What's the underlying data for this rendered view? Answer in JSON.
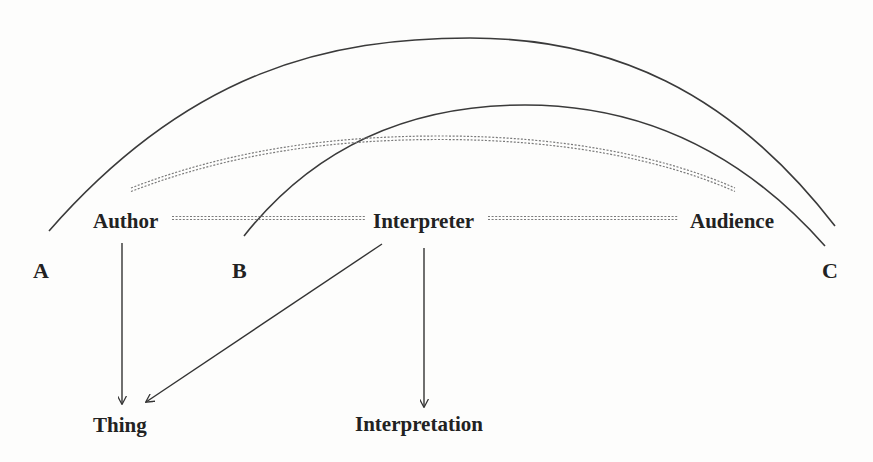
{
  "figure": {
    "type": "diagram"
  },
  "nodes": {
    "author": "Author",
    "interpreter": "Interpreter",
    "audience": "Audience",
    "thing": "Thing",
    "interpretation": "Interpretation"
  },
  "markers": {
    "a": "A",
    "b": "B",
    "c": "C"
  },
  "edges": [
    {
      "from": "Author",
      "to": "Thing",
      "style": "solid-arrow"
    },
    {
      "from": "Interpreter",
      "to": "Thing",
      "style": "solid-arrow"
    },
    {
      "from": "Interpreter",
      "to": "Interpretation",
      "style": "solid-arrow"
    },
    {
      "from": "Author",
      "to": "Interpreter",
      "style": "double-dashed"
    },
    {
      "from": "Interpreter",
      "to": "Audience",
      "style": "double-dashed"
    },
    {
      "from": "Author",
      "to": "Audience",
      "style": "double-dashed-arc"
    },
    {
      "from": "A",
      "to": "C",
      "style": "solid-arc"
    },
    {
      "from": "B",
      "to": "C",
      "style": "solid-arc"
    }
  ],
  "colors": {
    "line": "#3a3a3a",
    "dashed": "#7a7a7a",
    "text": "#222222",
    "background": "#fdfdfc"
  }
}
